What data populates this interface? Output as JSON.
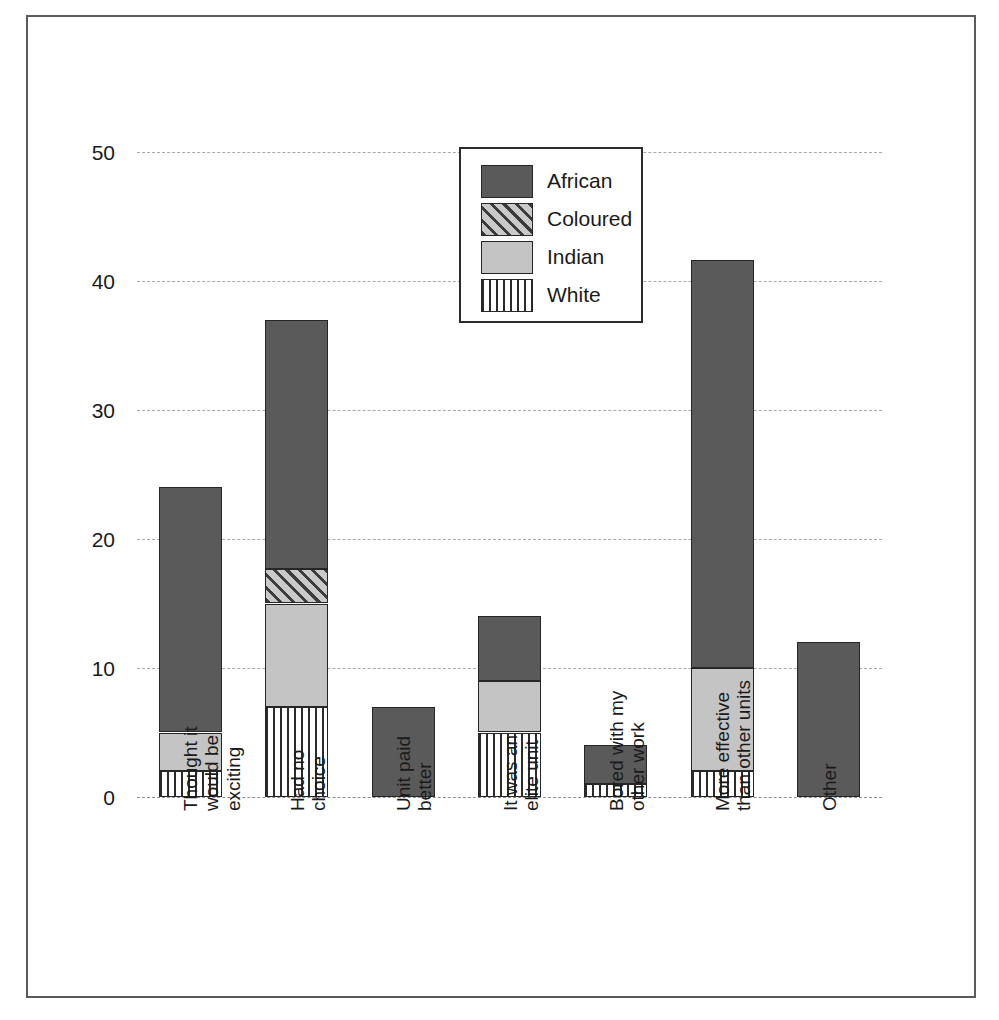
{
  "chart_data": {
    "type": "bar",
    "subtype": "stacked-bar",
    "title": "",
    "subtitle": "",
    "xlabel": "",
    "ylabel": "",
    "ylim": [
      0,
      50
    ],
    "ytick_values": [
      0,
      10,
      20,
      30,
      40,
      50
    ],
    "ytick_labels": [
      "0",
      "10",
      "20",
      "30",
      "40",
      "50"
    ],
    "grid": true,
    "grid_axis": "y",
    "grid_style": "dashed",
    "legend_position": "top-center",
    "legend_entries": [
      "African",
      "Coloured",
      "Indian",
      "White"
    ],
    "categories": [
      "Thought it\nwould be\nexciting",
      "Had no\nchoice",
      "Unit paid\nbetter",
      "It was an\nelite unit",
      "Bored with my\nother work",
      "More effective\nthan other units",
      "Other"
    ],
    "series": [
      {
        "name": "White",
        "color": "#ffffff",
        "pattern": "vertical-stripes",
        "values": [
          2,
          7,
          0,
          5,
          1,
          2,
          0
        ]
      },
      {
        "name": "Indian",
        "color": "#c4c4c4",
        "pattern": "solid-light",
        "values": [
          3,
          8,
          0,
          4,
          0,
          8,
          0
        ]
      },
      {
        "name": "Coloured",
        "color": "#9a9a9a",
        "pattern": "diagonal-hatch",
        "values": [
          0,
          2.7,
          0,
          0,
          0,
          0,
          0
        ]
      },
      {
        "name": "African",
        "color": "#5a5a5a",
        "pattern": "solid-dark",
        "values": [
          19,
          19.3,
          7,
          5,
          3,
          31.6,
          12
        ]
      }
    ],
    "totals": [
      24,
      37,
      7,
      14,
      4,
      41.6,
      12
    ]
  },
  "legend": {
    "items": [
      {
        "label": "African",
        "swatch": "african"
      },
      {
        "label": "Coloured",
        "swatch": "coloured"
      },
      {
        "label": "Indian",
        "swatch": "indian"
      },
      {
        "label": "White",
        "swatch": "white"
      }
    ]
  },
  "colors": {
    "african": "#5a5a5a",
    "coloured": "#9a9a9a",
    "indian": "#c4c4c4",
    "white": "#ffffff",
    "gridline": "#a8a8a8",
    "frame": "#5b5b5b",
    "text": "#1a1a1a"
  }
}
